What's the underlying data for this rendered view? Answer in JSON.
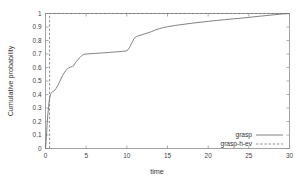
{
  "chart_data": {
    "type": "line",
    "title": "",
    "xlabel": "time",
    "ylabel": "Cumulative probability",
    "xlim": [
      0,
      30
    ],
    "ylim": [
      0,
      1
    ],
    "grid": false,
    "legend_position": "bottom-right",
    "xticks": [
      0,
      5,
      10,
      15,
      20,
      25,
      30
    ],
    "xticklabels": [
      "0",
      "5",
      "10",
      "15",
      "20",
      "25",
      "30"
    ],
    "yticks": [
      0,
      0.1,
      0.2,
      0.3,
      0.4,
      0.5,
      0.6,
      0.7,
      0.8,
      0.9,
      1
    ],
    "yticklabels": [
      "0",
      "0.1",
      "0.2",
      "0.3",
      "0.4",
      "0.5",
      "0.6",
      "0.7",
      "0.8",
      "0.9",
      "1"
    ],
    "series": [
      {
        "name": "grasp",
        "style": "solid",
        "color": "#737373",
        "x": [
          0.0,
          0.08,
          0.15,
          0.22,
          0.3,
          0.38,
          0.45,
          0.55,
          0.65,
          0.75,
          0.85,
          0.95,
          1.05,
          1.15,
          1.3,
          1.5,
          1.7,
          1.9,
          2.1,
          2.35,
          2.6,
          2.85,
          3.1,
          3.3,
          3.45,
          3.6,
          3.8,
          4.0,
          4.25,
          4.5,
          4.7,
          5.0,
          5.5,
          6.0,
          6.5,
          7.0,
          7.5,
          8.0,
          8.5,
          9.0,
          9.5,
          10.0,
          10.3,
          10.6,
          10.9,
          11.2,
          11.6,
          12.0,
          12.5,
          13.0,
          13.5,
          14.0,
          14.5,
          15.0,
          16.0,
          17.0,
          18.0,
          19.0,
          20.0,
          21.0,
          22.0,
          23.0,
          24.0,
          25.0,
          26.0,
          27.0,
          28.0,
          29.0,
          30.0
        ],
        "y": [
          0.0,
          0.06,
          0.13,
          0.2,
          0.26,
          0.31,
          0.35,
          0.385,
          0.405,
          0.415,
          0.42,
          0.423,
          0.427,
          0.432,
          0.445,
          0.465,
          0.49,
          0.515,
          0.54,
          0.565,
          0.585,
          0.597,
          0.603,
          0.607,
          0.612,
          0.628,
          0.645,
          0.66,
          0.675,
          0.69,
          0.697,
          0.7,
          0.702,
          0.704,
          0.706,
          0.708,
          0.71,
          0.712,
          0.715,
          0.717,
          0.72,
          0.723,
          0.745,
          0.78,
          0.815,
          0.83,
          0.838,
          0.845,
          0.855,
          0.865,
          0.878,
          0.888,
          0.895,
          0.902,
          0.912,
          0.92,
          0.928,
          0.935,
          0.942,
          0.948,
          0.954,
          0.96,
          0.965,
          0.971,
          0.978,
          0.984,
          0.99,
          0.996,
          1.0
        ]
      },
      {
        "name": "grasp-h-ev",
        "style": "dashed",
        "color": "#737373",
        "x": [
          0.5,
          0.5,
          30.0
        ],
        "y": [
          0.0,
          1.0,
          1.0
        ]
      }
    ]
  },
  "legend": {
    "entries": [
      {
        "label": "grasp"
      },
      {
        "label": "grasp-h-ev"
      }
    ]
  },
  "axes": {
    "x_title": "time",
    "y_title": "Cumulative probability"
  }
}
